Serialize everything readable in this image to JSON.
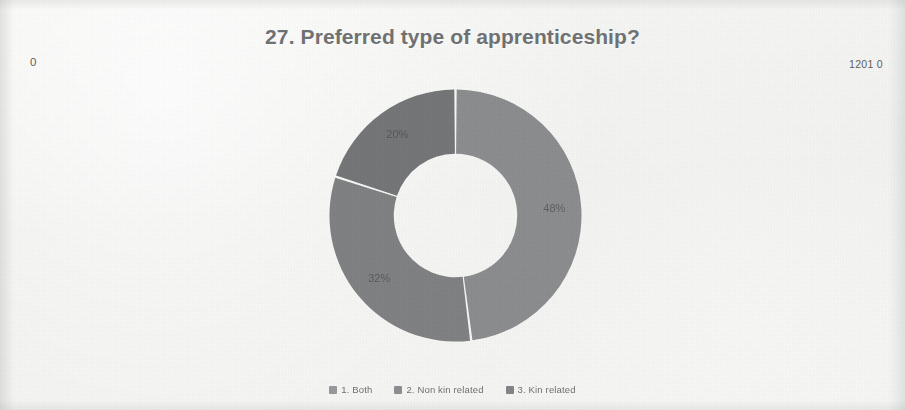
{
  "slide": {
    "title": "27. Preferred type of apprenticeship?",
    "corner_left": "0",
    "corner_right": "1201 0",
    "background_color": "#f2f2f0",
    "title_color": "#6f7072"
  },
  "legend": {
    "items": [
      {
        "marker": "legend-swatch-1",
        "label": "1. Both",
        "color": "#8a8b8d"
      },
      {
        "marker": "legend-swatch-2",
        "label": "2. Non kin related",
        "color": "#7e7f81"
      },
      {
        "marker": "legend-swatch-3",
        "label": "3. Kin related",
        "color": "#737476"
      }
    ]
  },
  "chart_data": {
    "type": "pie",
    "variant": "donut",
    "title": "27. Preferred type of apprenticeship?",
    "labels": [
      "1. Both",
      "2. Non kin related",
      "3. Kin related"
    ],
    "values": [
      48,
      32,
      20
    ],
    "value_labels": [
      "48%",
      "32%",
      "20%"
    ],
    "units": "percent",
    "colors": [
      "#8a8b8d",
      "#7e7f81",
      "#737476"
    ],
    "start_angle_deg": 0,
    "direction": "clockwise",
    "inner_radius_ratio": 0.49,
    "legend_position": "bottom",
    "grid": false,
    "xlabel": "",
    "ylabel": ""
  }
}
